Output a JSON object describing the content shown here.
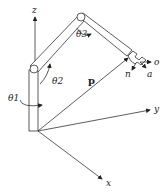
{
  "diagram": {
    "axes": {
      "x_label": "x",
      "y_label": "y",
      "z_label": "z"
    },
    "joints": {
      "theta1": "θ1",
      "theta2": "θ2",
      "theta3": "θ3"
    },
    "position_vector": "p",
    "end_effector_axes": {
      "n": "n",
      "o": "o",
      "a": "a"
    },
    "colors": {
      "line": "#333333",
      "background": "#ffffff"
    }
  }
}
